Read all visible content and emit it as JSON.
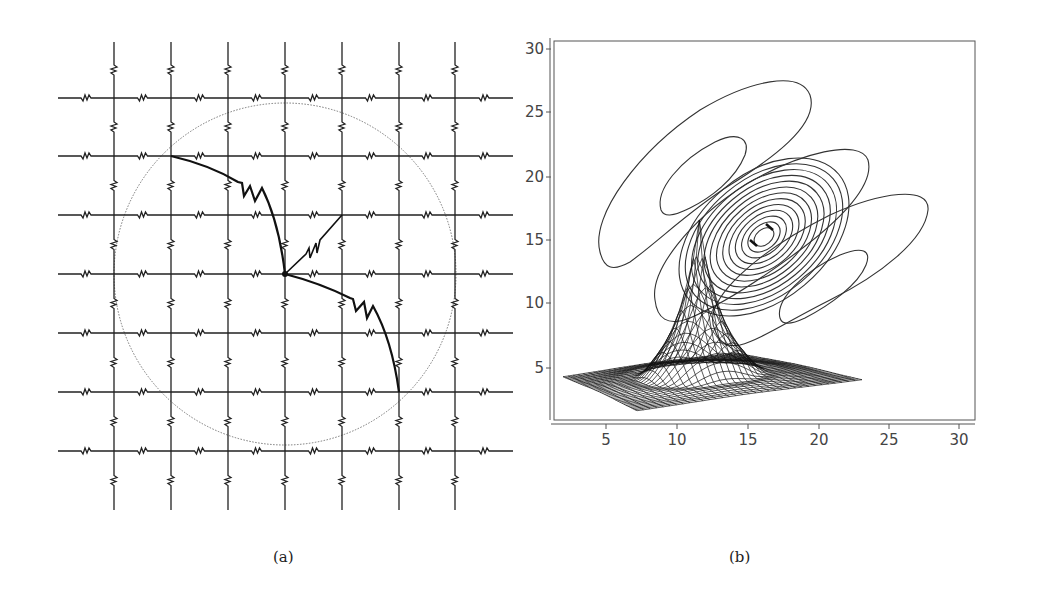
{
  "figure": {
    "panels": [
      {
        "id": "a",
        "caption": "(a)",
        "description": "Resistor lattice with circular boundary and arc-shaped resistor path through central node",
        "lattice": {
          "rows_y": [
            98,
            156,
            215,
            274,
            333,
            392,
            451
          ],
          "cols_x": [
            114,
            171,
            228,
            285,
            342,
            399,
            455
          ],
          "x_extent": [
            58,
            513
          ],
          "y_extent": [
            42,
            510
          ]
        },
        "circle": {
          "cx": 285,
          "cy": 274,
          "r": 171,
          "style": "dotted"
        },
        "center_node": {
          "x": 285,
          "y": 274
        }
      },
      {
        "id": "b",
        "caption": "(b)",
        "description": "Contour plot with 3D surface mesh overlay showing a sharp peak"
      }
    ]
  },
  "chart_data": [
    {
      "type": "diagram",
      "panel": "a",
      "title": "",
      "elements": [
        "square resistor grid 7x7 lines",
        "dotted circle",
        "bold arc with resistor through center",
        "diagonal resistor from center to upper-right"
      ]
    },
    {
      "type": "contour",
      "panel": "b",
      "title": "",
      "xlabel": "",
      "ylabel": "",
      "xlim": [
        1,
        31
      ],
      "ylim": [
        1,
        31
      ],
      "x_ticks": [
        5,
        10,
        15,
        20,
        25,
        30
      ],
      "y_ticks": [
        5,
        10,
        15,
        20,
        25,
        30
      ],
      "grid": false,
      "contour_center": {
        "x": 16,
        "y": 16
      },
      "contour_orientation_deg": 40,
      "num_central_rings": 13,
      "side_lobes": [
        {
          "x": 11,
          "y": 20.5,
          "note": "upper-left inner closed lobe"
        },
        {
          "x": 21,
          "y": 11,
          "note": "lower-right inner closed lobe"
        }
      ],
      "outer_lobes": [
        {
          "x": 13,
          "y": 20,
          "note": "large upper-left outer lobe"
        },
        {
          "x": 21,
          "y": 14,
          "note": "large right outer lobe"
        }
      ],
      "surface_overlay": {
        "peak_x": 11.5,
        "peak_y": 17.5,
        "base_y_range": [
          1.5,
          5.5
        ],
        "base_x_range": [
          2,
          23
        ]
      }
    }
  ],
  "axes_b": {
    "y_ticks": [
      {
        "label": "30",
        "y": 49
      },
      {
        "label": "25",
        "y": 112
      },
      {
        "label": "20",
        "y": 177
      },
      {
        "label": "15",
        "y": 240
      },
      {
        "label": "10",
        "y": 303
      },
      {
        "label": "5",
        "y": 368
      }
    ],
    "x_ticks": [
      {
        "label": "5",
        "x": 606
      },
      {
        "label": "10",
        "x": 677
      },
      {
        "label": "15",
        "x": 748
      },
      {
        "label": "20",
        "x": 819
      },
      {
        "label": "25",
        "x": 889
      },
      {
        "label": "30",
        "x": 959
      }
    ]
  },
  "captions": {
    "a": "(a)",
    "b": "(b)"
  }
}
